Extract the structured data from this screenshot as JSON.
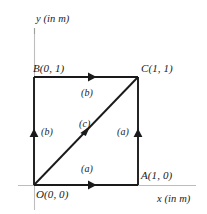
{
  "figure": {
    "axes": {
      "x_label": "x (in m)",
      "y_label": "y (in m)",
      "axis_color": "#b3b3b3"
    },
    "vertices": [
      {
        "id": "O",
        "label": "O(0, 0)",
        "x": 0,
        "y": 0
      },
      {
        "id": "A",
        "label": "A(1, 0)",
        "x": 1,
        "y": 0
      },
      {
        "id": "C",
        "label": "C(1, 1)",
        "x": 1,
        "y": 1
      },
      {
        "id": "B",
        "label": "B(0, 1)",
        "x": 0,
        "y": 1
      }
    ],
    "paths": [
      {
        "id": "bottom",
        "label": "(a)",
        "from": "O",
        "to": "A",
        "direction": "right"
      },
      {
        "id": "right",
        "label": "(a)",
        "from": "A",
        "to": "C",
        "direction": "up"
      },
      {
        "id": "left",
        "label": "(b)",
        "from": "O",
        "to": "B",
        "direction": "up"
      },
      {
        "id": "top",
        "label": "(b)",
        "from": "B",
        "to": "C",
        "direction": "right"
      },
      {
        "id": "diagonal",
        "label": "(c)",
        "from": "O",
        "to": "C",
        "direction": "up-right"
      }
    ],
    "colors": {
      "square_stroke": "#1a1a1a",
      "diagonal_stroke": "#1a1a1a",
      "text": "#1a1a1a",
      "background": "#ffffff"
    }
  }
}
